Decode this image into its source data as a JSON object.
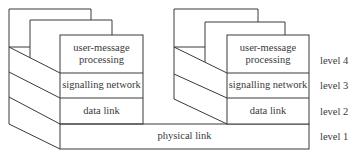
{
  "diagram": {
    "type": "layered protocol stack",
    "stacks": [
      {
        "id": "left",
        "layers": [
          {
            "label_line1": "user-message",
            "label_line2": "processing"
          },
          {
            "label": "signalling network"
          },
          {
            "label": "data link"
          }
        ]
      },
      {
        "id": "right",
        "layers": [
          {
            "label_line1": "user-message",
            "label_line2": "processing"
          },
          {
            "label": "signalling network"
          },
          {
            "label": "data link"
          }
        ]
      }
    ],
    "shared_layer": {
      "label": "physical link"
    },
    "levels": [
      "level 4",
      "level 3",
      "level 2",
      "level 1"
    ],
    "line_color": "#3a3a3a"
  }
}
